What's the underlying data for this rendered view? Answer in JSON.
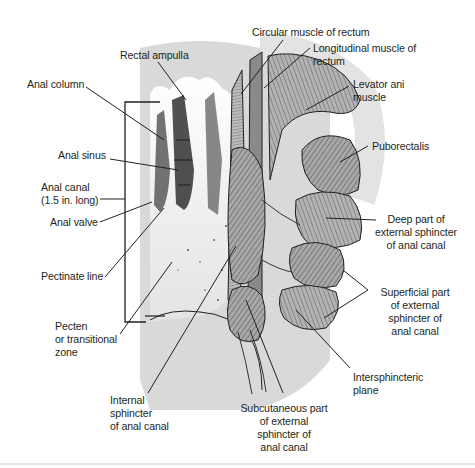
{
  "figure": {
    "colors": {
      "background": "#ffffff",
      "rectum_shadow": "#d9d9d9",
      "mucosa": "#f2f2f2",
      "muscle_fill": "#9a9a9a",
      "muscle_light": "#c4c4c4",
      "ink": "#231f20"
    },
    "labels": {
      "rectal_ampulla": "Rectal ampulla",
      "anal_column": "Anal column",
      "anal_sinus": "Anal sinus",
      "anal_canal": "Anal canal\n(1.5 in. long)",
      "anal_valve": "Anal valve",
      "pectinate_line": "Pectinate line",
      "pecten": "Pecten\nor transitional\nzone",
      "internal_sphincter": "Internal\nsphincter\nof anal canal",
      "circular_muscle": "Circular muscle of rectum",
      "longitudinal_muscle": "Longitudinal muscle of\nrectum",
      "levator_ani": "Levator ani\nmuscle",
      "puborectalis": "Puborectalis",
      "deep_external": "Deep part of\nexternal sphincter\nof anal canal",
      "superficial_external": "Superficial part\nof external\nsphincter of\nanal canal",
      "intersphincteric_plane": "Intersphincteric\nplane",
      "subcutaneous_external": "Subcutaneous part\nof external\nsphincter of\nanal canal"
    }
  }
}
